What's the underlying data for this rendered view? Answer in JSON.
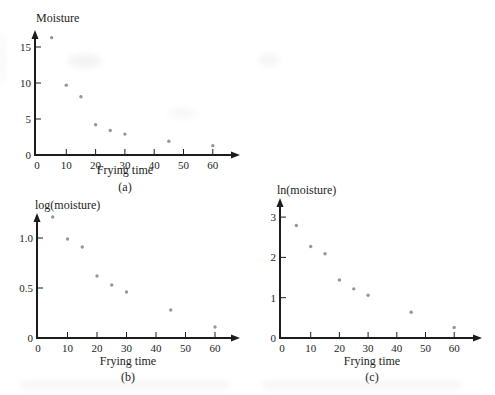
{
  "figure": {
    "background": "#ffffff",
    "axis_color": "#1c1c1c",
    "text_color": "#1c1c1c",
    "point_color": "#8d8a87"
  },
  "chart_data": [
    {
      "id": "a",
      "type": "scatter",
      "title": "",
      "ylabel": "Moisture",
      "xlabel": "Frying time",
      "caption": "(a)",
      "x": [
        5,
        10,
        15,
        20,
        25,
        30,
        45,
        60
      ],
      "y": [
        16.3,
        9.7,
        8.1,
        4.2,
        3.4,
        2.9,
        1.9,
        1.3
      ],
      "xticks": [
        10,
        20,
        30,
        40,
        50,
        60
      ],
      "xtick_labels": [
        "10",
        "20",
        "30",
        "40",
        "50",
        "60"
      ],
      "yticks": [
        5,
        10,
        15
      ],
      "ytick_labels": [
        "5",
        "10",
        "15"
      ],
      "origin_label": "0",
      "xlim": [
        0,
        68
      ],
      "ylim": [
        0,
        17.5
      ],
      "grid": false,
      "legend": "none"
    },
    {
      "id": "b",
      "type": "scatter",
      "title": "",
      "ylabel": "log(moisture)",
      "xlabel": "Frying time",
      "caption": "(b)",
      "x": [
        5,
        10,
        15,
        20,
        25,
        30,
        45,
        60
      ],
      "y": [
        1.21,
        0.99,
        0.91,
        0.62,
        0.53,
        0.46,
        0.28,
        0.11
      ],
      "xticks": [
        10,
        20,
        30,
        40,
        50,
        60
      ],
      "xtick_labels": [
        "10",
        "20",
        "30",
        "40",
        "50",
        "60"
      ],
      "yticks": [
        0.5,
        1.0
      ],
      "ytick_labels": [
        "0.5",
        "1.0"
      ],
      "origin_label": "0",
      "xlim": [
        0,
        68
      ],
      "ylim": [
        0,
        1.3
      ],
      "grid": false,
      "legend": "none"
    },
    {
      "id": "c",
      "type": "scatter",
      "title": "",
      "ylabel": "ln(moisture)",
      "xlabel": "Frying time",
      "caption": "(c)",
      "x": [
        5,
        10,
        15,
        20,
        25,
        30,
        45,
        60
      ],
      "y": [
        2.79,
        2.27,
        2.09,
        1.44,
        1.22,
        1.06,
        0.64,
        0.26
      ],
      "xticks": [
        10,
        20,
        30,
        40,
        50,
        60
      ],
      "xtick_labels": [
        "10",
        "20",
        "30",
        "40",
        "50",
        "60"
      ],
      "yticks": [
        1,
        2,
        3
      ],
      "ytick_labels": [
        "1",
        "2",
        "3"
      ],
      "origin_label": "0",
      "xlim": [
        0,
        68
      ],
      "ylim": [
        0,
        3.5
      ],
      "grid": false,
      "legend": "none"
    }
  ]
}
